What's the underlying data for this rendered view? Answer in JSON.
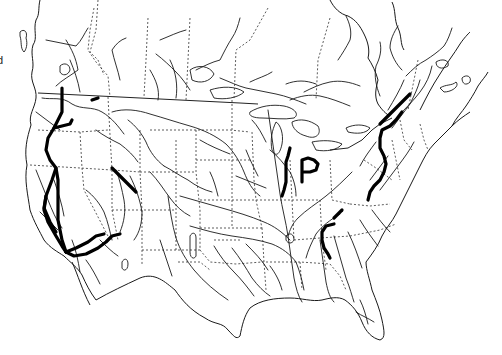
{
  "map": {
    "region": "North America (contiguous United States and southern Canada)",
    "edge_label": "d",
    "style": "black line-art on white",
    "colors": {
      "background": "#ffffff",
      "lines": "#1a1a1a",
      "highlight_routes": "#000000"
    },
    "layers": [
      {
        "name": "rivers",
        "style": "thin solid"
      },
      {
        "name": "political-boundaries",
        "style": "dashed"
      },
      {
        "name": "coastline",
        "style": "thin solid"
      },
      {
        "name": "highlighted-routes",
        "style": "thick solid black"
      }
    ],
    "highlighted_routes": [
      {
        "id": "pacific-northwest",
        "area": "Washington / Oregon"
      },
      {
        "id": "california-central-valley",
        "area": "California"
      },
      {
        "id": "southern-california-arizona",
        "area": "Southern California / Arizona"
      },
      {
        "id": "great-basin-diagonal",
        "area": "Idaho / Utah"
      },
      {
        "id": "great-lakes-west",
        "area": "Michigan / Wisconsin"
      },
      {
        "id": "p-shaped-michigan",
        "area": "Michigan"
      },
      {
        "id": "appalachian-northeast",
        "area": "New York / Pennsylvania / Quebec"
      },
      {
        "id": "tennessee-alabama",
        "area": "Tennessee / Alabama"
      },
      {
        "id": "montana-short",
        "area": "Northern Rockies"
      }
    ]
  }
}
